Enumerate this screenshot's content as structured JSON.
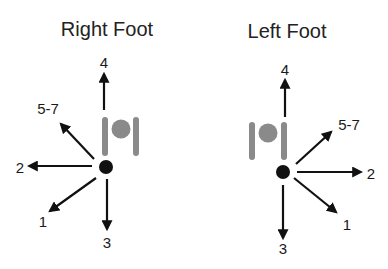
{
  "diagram": {
    "colors": {
      "arrow": "#111111",
      "dot": "#111111",
      "symbol": "#8a8a8a",
      "background": "#ffffff"
    },
    "panels": [
      {
        "title": "Right Foot",
        "labels": {
          "four": "4",
          "five_seven": "5-7",
          "two": "2",
          "one": "1",
          "three": "3"
        }
      },
      {
        "title": "Left Foot",
        "labels": {
          "four": "4",
          "five_seven": "5-7",
          "two": "2",
          "one": "1",
          "three": "3"
        }
      }
    ]
  }
}
